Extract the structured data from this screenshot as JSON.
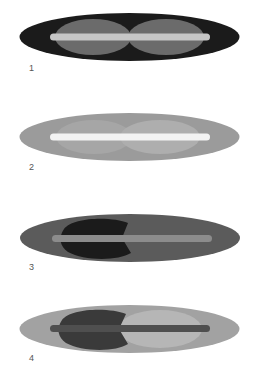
{
  "figures": [
    {
      "label": "1",
      "top": 10,
      "outer_color": "#1b1b1b",
      "inner_left_color": "#6b6b6b",
      "inner_right_color": "#6b6b6b",
      "bar_color": "#c6c6c6",
      "left_shape": "ellipse"
    },
    {
      "label": "2",
      "top": 110,
      "outer_color": "#9b9b9b",
      "inner_left_color": "#a6a6a6",
      "inner_right_color": "#aeaeae",
      "bar_color": "#f3f3f3",
      "left_shape": "ellipse"
    },
    {
      "label": "3",
      "top": 211,
      "outer_color": "#5b5b5b",
      "inner_left_color": "#1b1b1b",
      "inner_right_color": "#5b5b5b",
      "bar_color": "#8c8c8c",
      "left_shape": "notched"
    },
    {
      "label": "4",
      "top": 302,
      "outer_color": "#a2a2a2",
      "inner_left_color": "#3a3a3a",
      "inner_right_color": "#b6b6b6",
      "bar_color": "#4f4f4f",
      "left_shape": "notched"
    }
  ]
}
